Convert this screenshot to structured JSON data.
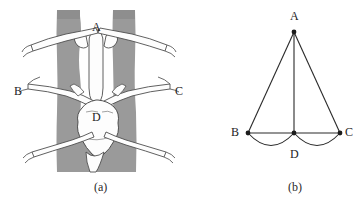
{
  "figure": {
    "width": 363,
    "height": 207,
    "background": "#ffffff",
    "ink_color": "#1c1c1c",
    "tissue_gray": "#9a9a9a",
    "vessel_white": "#fdfdfd"
  },
  "panel_a": {
    "caption": "(a)",
    "description": "shaded anatomical cross-section with white branching vessels",
    "labels": [
      {
        "text": "A",
        "x": 92,
        "y": 21
      },
      {
        "text": "B",
        "x": 14,
        "y": 85
      },
      {
        "text": "C",
        "x": 175,
        "y": 85
      },
      {
        "text": "D",
        "x": 92,
        "y": 111
      }
    ]
  },
  "panel_b": {
    "caption": "(b)",
    "description": "schematic triangle with apex A, base endpoints B and C, midpoint D and two downward arcs",
    "labels": [
      {
        "text": "A",
        "x": 100,
        "y": 10
      },
      {
        "text": "B",
        "x": 41,
        "y": 126
      },
      {
        "text": "C",
        "x": 155,
        "y": 126
      },
      {
        "text": "D",
        "x": 100,
        "y": 148
      }
    ],
    "vertices": [
      {
        "name": "A",
        "x": 104,
        "y": 32
      },
      {
        "name": "B",
        "x": 58,
        "y": 133
      },
      {
        "name": "C",
        "x": 150,
        "y": 133
      },
      {
        "name": "D",
        "x": 104,
        "y": 133
      }
    ],
    "edges": [
      "A-B",
      "A-C",
      "A-D",
      "B-C"
    ],
    "arcs": [
      "B-D",
      "D-C"
    ]
  }
}
